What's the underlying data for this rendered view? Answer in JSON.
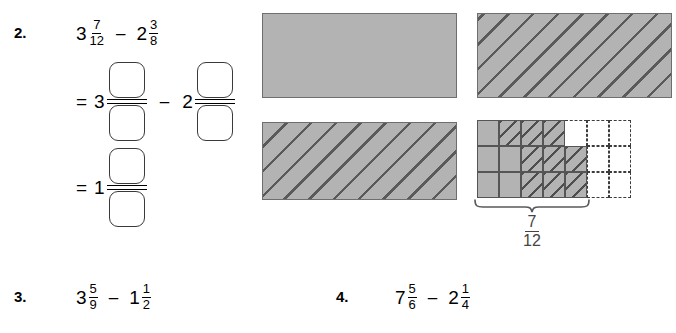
{
  "problems": [
    {
      "number": "2.",
      "expression": {
        "left": {
          "whole": "3",
          "numerator": "7",
          "denominator": "12"
        },
        "operator": "–",
        "right": {
          "whole": "2",
          "numerator": "3",
          "denominator": "8"
        }
      },
      "work_lines": [
        {
          "equals": "=",
          "left_whole": "3",
          "operator": "–",
          "right_whole": "2"
        },
        {
          "equals": "=",
          "left_whole": "1"
        }
      ]
    },
    {
      "number": "3.",
      "expression": {
        "left": {
          "whole": "3",
          "numerator": "5",
          "denominator": "9"
        },
        "operator": "–",
        "right": {
          "whole": "1",
          "numerator": "1",
          "denominator": "2"
        }
      }
    },
    {
      "number": "4.",
      "expression": {
        "left": {
          "whole": "7",
          "numerator": "5",
          "denominator": "6"
        },
        "operator": "–",
        "right": {
          "whole": "2",
          "numerator": "1",
          "denominator": "4"
        }
      }
    }
  ],
  "diagrams": {
    "rect_top_left": {
      "fill": "solid",
      "color": "#b3b3b3"
    },
    "rect_top_right": {
      "fill": "hatched",
      "color": "#b3b3b3"
    },
    "rect_bottom_left": {
      "fill": "hatched",
      "color": "#b3b3b3"
    },
    "grid": {
      "rows": 3,
      "columns": 6,
      "shaded_cells": 7,
      "label": {
        "numerator": "7",
        "denominator": "12"
      }
    }
  },
  "colors": {
    "shade_gray": "#b3b3b3",
    "border_gray": "#6e6e6e",
    "hatch_line": "#5a5a5a",
    "dashed_border": "#3c3c3c",
    "text": "#000000"
  }
}
